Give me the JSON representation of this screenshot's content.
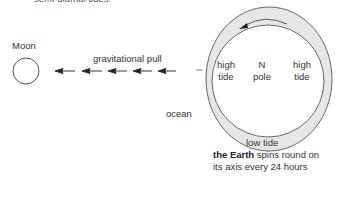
{
  "header": {
    "clipped_text": "semi-diurnal tides."
  },
  "moon": {
    "label": "Moon"
  },
  "force": {
    "label": "gravitational pull",
    "arrow_count": 5
  },
  "earth": {
    "ocean_label": "ocean",
    "high_tide_left": [
      "high",
      "tide"
    ],
    "high_tide_right": [
      "high",
      "tide"
    ],
    "pole": [
      "N",
      "pole"
    ],
    "low_tide_label": "low tide",
    "caption_bold": "the Earth",
    "caption_rest_line1": " spins round on",
    "caption_line2": "its axis every 24 hours"
  },
  "colors": {
    "ocean_fill": "#e6e6e6",
    "stroke": "#555555",
    "background": "#ffffff"
  }
}
